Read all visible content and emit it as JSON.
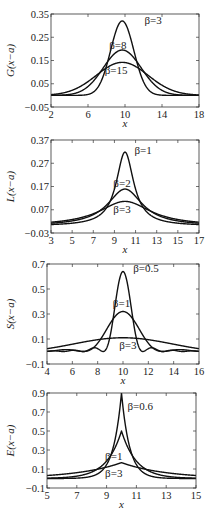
{
  "chart_data": [
    {
      "type": "line",
      "id": "gaussian",
      "ylabel": "G(x−a)",
      "xlabel": "x",
      "xlim": [
        2,
        18
      ],
      "ylim": [
        -0.05,
        0.35
      ],
      "xticks": [
        2,
        6,
        10,
        14,
        18
      ],
      "yticks": [
        -0.05,
        0.05,
        0.15,
        0.25,
        0.35
      ],
      "ytick_labels": [
        "−0.05",
        "0.05",
        "0.15",
        "0.25",
        "0.35"
      ],
      "frame": {
        "top": 14,
        "left": 51,
        "right": 199,
        "bottom": 107
      },
      "series": [
        {
          "name": "β=3",
          "kind": "gauss",
          "center": 9.7,
          "peak": 0.32,
          "width": 1.25
        },
        {
          "name": "β=8",
          "kind": "gauss",
          "center": 9.7,
          "peak": 0.195,
          "width": 2.05
        },
        {
          "name": "β=15",
          "kind": "gauss",
          "center": 9.7,
          "peak": 0.142,
          "width": 2.8
        }
      ],
      "annotations": [
        {
          "text": "β=3",
          "x": 12.1,
          "y": 0.305
        },
        {
          "text": "β=8",
          "x": 8.3,
          "y": 0.2
        },
        {
          "text": "β=15",
          "x": 7.8,
          "y": 0.09
        }
      ]
    },
    {
      "type": "line",
      "id": "lorentzian",
      "ylabel": "L(x−a)",
      "xlabel": "x",
      "xlim": [
        3,
        17
      ],
      "ylim": [
        -0.03,
        0.37
      ],
      "xticks": [
        3,
        5,
        7,
        9,
        11,
        13,
        15,
        17
      ],
      "yticks": [
        -0.03,
        0.07,
        0.17,
        0.27,
        0.37
      ],
      "ytick_labels": [
        "−0.03",
        "0.07",
        "0.17",
        "0.27",
        "0.37"
      ],
      "frame": {
        "top": 140,
        "left": 51,
        "right": 199,
        "bottom": 233
      },
      "series": [
        {
          "name": "β=1",
          "kind": "lorentz",
          "center": 10,
          "peak": 0.318,
          "width": 1
        },
        {
          "name": "β=2",
          "kind": "lorentz",
          "center": 10,
          "peak": 0.159,
          "width": 2
        },
        {
          "name": "β=3",
          "kind": "lorentz",
          "center": 10,
          "peak": 0.106,
          "width": 3
        }
      ],
      "annotations": [
        {
          "text": "β=1",
          "x": 10.9,
          "y": 0.31
        },
        {
          "text": "β=2",
          "x": 8.9,
          "y": 0.17
        },
        {
          "text": "β=3",
          "x": 8.9,
          "y": 0.055
        }
      ]
    },
    {
      "type": "line",
      "id": "sinc",
      "ylabel": "S(x−a)",
      "xlabel": "x",
      "xlim": [
        4,
        16
      ],
      "ylim": [
        -0.1,
        0.7
      ],
      "xticks": [
        4,
        6,
        8,
        10,
        12,
        14,
        16
      ],
      "yticks": [
        -0.1,
        0.1,
        0.3,
        0.5,
        0.7
      ],
      "ytick_labels": [
        "−0.1",
        "0.1",
        "0.3",
        "0.5",
        "0.7"
      ],
      "frame": {
        "top": 264,
        "left": 47,
        "right": 199,
        "bottom": 364
      },
      "series": [
        {
          "name": "β=0.5",
          "kind": "sinc2",
          "center": 10,
          "peak": 0.64,
          "width": 0.5
        },
        {
          "name": "β=1",
          "kind": "sinc2",
          "center": 10,
          "peak": 0.32,
          "width": 1
        },
        {
          "name": "β=3",
          "kind": "sinc2",
          "center": 10,
          "peak": 0.11,
          "width": 3
        }
      ],
      "annotations": [
        {
          "text": "β=0.5",
          "x": 10.8,
          "y": 0.64
        },
        {
          "text": "β=1",
          "x": 9.2,
          "y": 0.36
        },
        {
          "text": "β=3",
          "x": 9.7,
          "y": 0.02
        }
      ]
    },
    {
      "type": "line",
      "id": "exponential",
      "ylabel": "E(x−a)",
      "xlabel": "x",
      "xlim": [
        5,
        15
      ],
      "ylim": [
        -0.1,
        0.9
      ],
      "xticks": [
        5,
        7,
        9,
        11,
        13,
        15
      ],
      "yticks": [
        -0.1,
        0.1,
        0.3,
        0.5,
        0.7,
        0.9
      ],
      "ytick_labels": [
        "−0.1",
        "0.1",
        "0.3",
        "0.5",
        "0.7",
        "0.9"
      ],
      "frame": {
        "top": 393,
        "left": 47,
        "right": 196,
        "bottom": 488
      },
      "series": [
        {
          "name": "β=0.6",
          "kind": "laplace",
          "center": 10,
          "peak": 0.9,
          "width": 0.55
        },
        {
          "name": "β=1",
          "kind": "laplace",
          "center": 10,
          "peak": 0.5,
          "width": 1
        },
        {
          "name": "β=3",
          "kind": "laplace",
          "center": 10,
          "peak": 0.167,
          "width": 3
        }
      ],
      "annotations": [
        {
          "text": "β=0.6",
          "x": 10.4,
          "y": 0.72
        },
        {
          "text": "β=1",
          "x": 8.9,
          "y": 0.2
        },
        {
          "text": "β=3",
          "x": 8.9,
          "y": 0.02
        }
      ]
    }
  ]
}
